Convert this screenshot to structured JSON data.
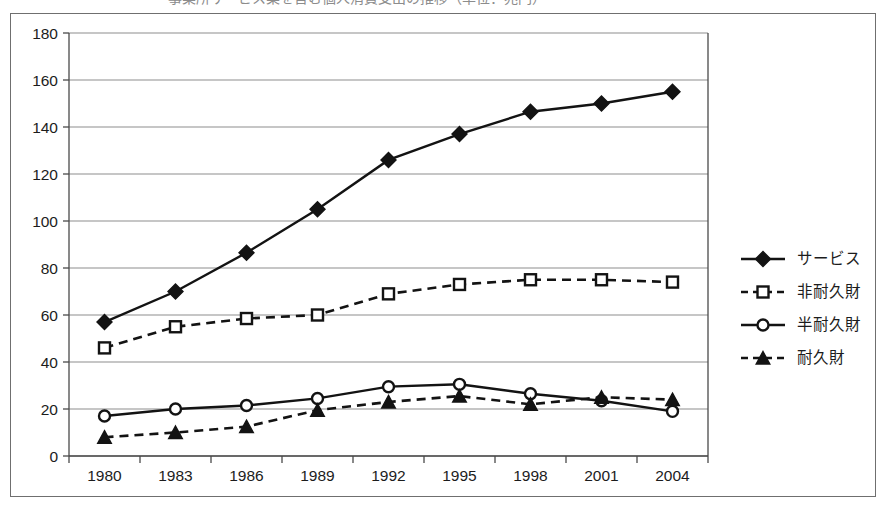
{
  "figure": {
    "title_sliver": "事業所サービス業を含む個人消費支出の推移（単位：兆円）",
    "title_visible": false,
    "border_color": "#6f6f6f",
    "background": "#ffffff",
    "ink_color": "#131313",
    "grid_color": "#8d8d8d"
  },
  "chart_data": {
    "type": "line",
    "title": "",
    "xlabel": "",
    "ylabel": "",
    "categories": [
      "1980",
      "1983",
      "1986",
      "1989",
      "1992",
      "1995",
      "1998",
      "2001",
      "2004"
    ],
    "x": [
      1980,
      1983,
      1986,
      1989,
      1992,
      1995,
      1998,
      2001,
      2004
    ],
    "ylim": [
      0,
      180
    ],
    "yticks": [
      0,
      20,
      40,
      60,
      80,
      100,
      120,
      140,
      160,
      180
    ],
    "grid": true,
    "legend_position": "right",
    "series": [
      {
        "name": "サービス",
        "marker": "diamond",
        "marker_fill": "solid",
        "linestyle": "solid",
        "values": [
          57,
          70,
          86.5,
          105,
          126,
          137,
          146.5,
          150,
          155
        ]
      },
      {
        "name": "非耐久財",
        "marker": "square",
        "marker_fill": "hollow",
        "linestyle": "dashed",
        "values": [
          46,
          55,
          58.5,
          60,
          69,
          73,
          75,
          75,
          74
        ]
      },
      {
        "name": "半耐久財",
        "marker": "circle",
        "marker_fill": "hollow",
        "linestyle": "solid",
        "values": [
          17,
          20,
          21.5,
          24.5,
          29.5,
          30.5,
          26.5,
          23.5,
          19
        ]
      },
      {
        "name": "耐久財",
        "marker": "triangle",
        "marker_fill": "solid",
        "linestyle": "dashed",
        "values": [
          8,
          10,
          12.5,
          19.5,
          23,
          25.5,
          22,
          25,
          24
        ]
      }
    ]
  },
  "legend": {
    "items": [
      {
        "label": "サービス",
        "marker": "diamond",
        "fill": "solid",
        "line": "solid"
      },
      {
        "label": "非耐久財",
        "marker": "square",
        "fill": "hollow",
        "line": "dashed"
      },
      {
        "label": "半耐久財",
        "marker": "circle",
        "fill": "hollow",
        "line": "solid"
      },
      {
        "label": "耐久財",
        "marker": "triangle",
        "fill": "solid",
        "line": "dashed"
      }
    ]
  }
}
